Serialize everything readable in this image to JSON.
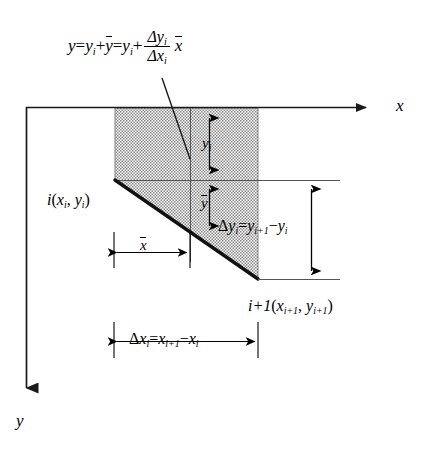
{
  "figure": {
    "background_color": "#ffffff",
    "line_color": "#000000",
    "hatch_fill": "#d8d8d8",
    "equation": {
      "lhs": "y",
      "eq1": "=",
      "term_yi_a": "y",
      "sub_i_a": "i",
      "plus_a": "+",
      "ybar_a": "y",
      "eq2": "=",
      "term_yi_b": "y",
      "sub_i_b": "i",
      "plus_b": "+",
      "frac_numerator_delta": "Δ",
      "frac_numerator_var": "y",
      "frac_numerator_sub": "i",
      "frac_denominator_delta": "Δ",
      "frac_denominator_var": "x",
      "frac_denominator_sub": "i",
      "multiplier_xbar": "x",
      "plain_text": "y = y_i + ȳ = y_i + (Δy_i / Δx_i) x̄"
    },
    "axes": {
      "x_label": "x",
      "y_label": "y",
      "x_direction": "right",
      "y_direction": "down"
    },
    "points": [
      {
        "name": "point-i",
        "prefix": "i",
        "open_paren": "(",
        "var_x": "x",
        "sub_x": "i",
        "comma": ",",
        "var_y": "y",
        "sub_y": "i",
        "close_paren": ")",
        "plain_text": "i(x_i, y_i)"
      },
      {
        "name": "point-i-plus-1",
        "prefix": "i+1",
        "open_paren": "(",
        "var_x": "x",
        "sub_x": "i+1",
        "comma": ",",
        "var_y": "y",
        "sub_y": "i+1",
        "close_paren": ")",
        "plain_text": "i+1(x_{i+1}, y_{i+1})"
      }
    ],
    "dimensions": [
      {
        "name": "yi",
        "var": "y",
        "sub": "i",
        "plain_text": "y_i",
        "orientation": "vertical"
      },
      {
        "name": "ybar",
        "var": "y",
        "plain_text": "ȳ",
        "orientation": "vertical"
      },
      {
        "name": "xbar",
        "var": "x",
        "plain_text": "x̄",
        "orientation": "horizontal"
      },
      {
        "name": "delta-yi",
        "delta": "Δ",
        "var": "y",
        "sub": "i",
        "equals": "=",
        "rhs_var1": "y",
        "rhs_sub1": "i+1",
        "minus": "−",
        "rhs_var2": "y",
        "rhs_sub2": "i",
        "plain_text": "Δy_i = y_{i+1} − y_i",
        "orientation": "vertical"
      },
      {
        "name": "delta-xi",
        "delta": "Δ",
        "var": "x",
        "sub": "i",
        "equals": "=",
        "rhs_var1": "x",
        "rhs_sub1": "i+1",
        "minus": "−",
        "rhs_var2": "x",
        "rhs_sub2": "i",
        "plain_text": "Δx_i = x_{i+1} − x_i",
        "orientation": "horizontal"
      }
    ]
  }
}
